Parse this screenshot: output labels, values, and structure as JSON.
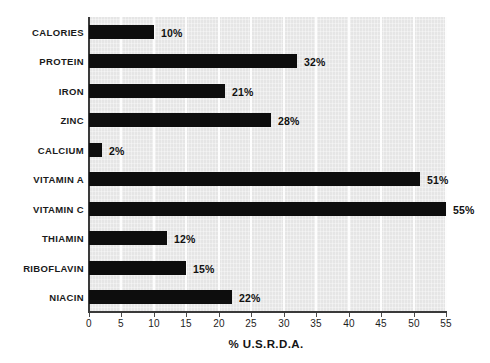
{
  "chart_data": {
    "type": "bar",
    "orientation": "horizontal",
    "title": "",
    "xlabel": "% U.S.R.D.A.",
    "ylabel": "",
    "xlim": [
      0,
      55
    ],
    "xticks": [
      0,
      5,
      10,
      15,
      20,
      25,
      30,
      35,
      40,
      45,
      50,
      55
    ],
    "xtick_labels": [
      "0",
      "5",
      "10",
      "15",
      "20",
      "25",
      "30",
      "35",
      "40",
      "45",
      "50",
      "55"
    ],
    "grid": "vertical",
    "legend": "none",
    "bar_color": "#0d0d0d",
    "plot_background": "#e9e9e9",
    "categories": [
      "CALORIES",
      "PROTEIN",
      "IRON",
      "ZINC",
      "CALCIUM",
      "VITAMIN A",
      "VITAMIN C",
      "THIAMIN",
      "RIBOFLAVIN",
      "NIACIN"
    ],
    "values": [
      10,
      32,
      21,
      28,
      2,
      51,
      55,
      12,
      15,
      22
    ],
    "data_labels": [
      "10%",
      "32%",
      "21%",
      "28%",
      "2%",
      "51%",
      "55%",
      "12%",
      "15%",
      "22%"
    ]
  }
}
